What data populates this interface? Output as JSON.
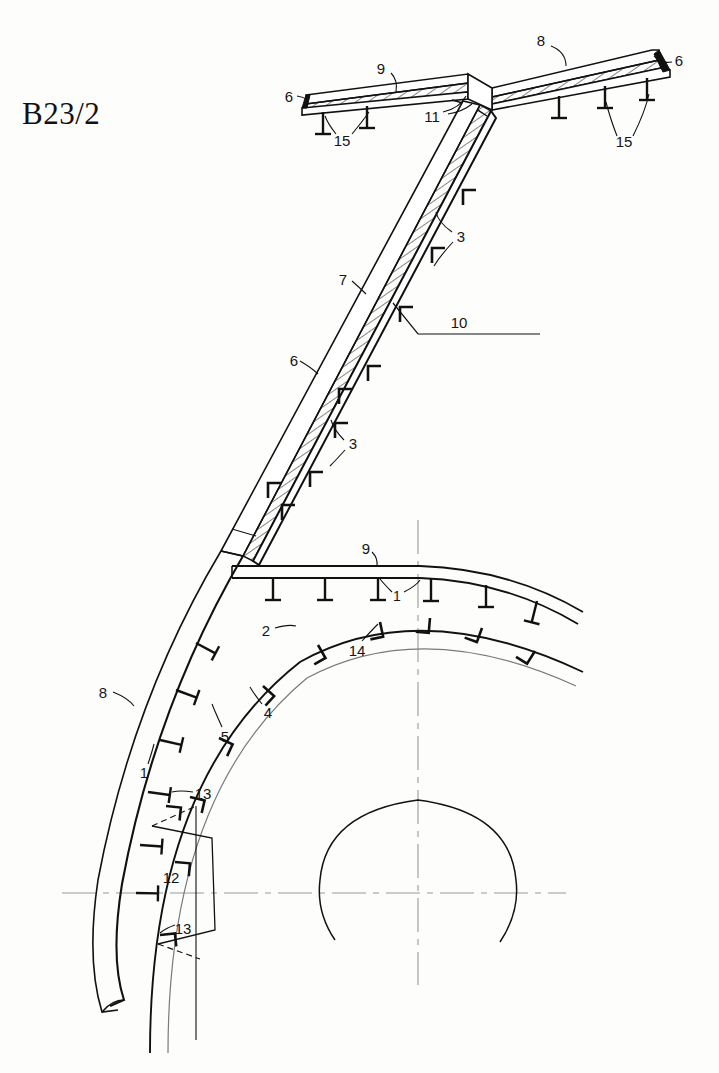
{
  "sheet": {
    "title": "B23/2",
    "background_color": "#fdfdfc",
    "ink_color": "#111111",
    "centerline_color": "#999999",
    "width": 719,
    "height": 1073
  },
  "drawing": {
    "type": "engineering-cross-section",
    "description": "Ship hull transverse frame section B23/2 with deck, diagonal strut, curved shell plating and stiffeners",
    "units": "unitless part-reference numbers"
  },
  "callouts": [
    {
      "id": "c-8-top",
      "text": "8",
      "x": 541,
      "y": 40,
      "target": "upper-right-deck-beam"
    },
    {
      "id": "c-6-tr",
      "text": "6",
      "x": 679,
      "y": 60,
      "target": "right-beam-edge-plate"
    },
    {
      "id": "c-9-top",
      "text": "9",
      "x": 381,
      "y": 68,
      "target": "upper-left-deck-plate"
    },
    {
      "id": "c-6-tl",
      "text": "6",
      "x": 289,
      "y": 96,
      "target": "left-beam-edge-plate"
    },
    {
      "id": "c-11",
      "text": "11",
      "x": 432,
      "y": 116,
      "target": "knee-bracket-fillet"
    },
    {
      "id": "c-15-l",
      "text": "15",
      "x": 342,
      "y": 140,
      "target": "left-deck-stiffeners"
    },
    {
      "id": "c-15-r",
      "text": "15",
      "x": 624,
      "y": 141,
      "target": "right-deck-stiffeners"
    },
    {
      "id": "c-3-up",
      "text": "3",
      "x": 461,
      "y": 236,
      "target": "strut-upper-brackets"
    },
    {
      "id": "c-7",
      "text": "7",
      "x": 343,
      "y": 279,
      "target": "diagonal-strut-web"
    },
    {
      "id": "c-10",
      "text": "10",
      "x": 459,
      "y": 322,
      "target": "reference-waterline"
    },
    {
      "id": "c-6-mid",
      "text": "6",
      "x": 294,
      "y": 360,
      "target": "strut-flange-plate"
    },
    {
      "id": "c-3-lo",
      "text": "3",
      "x": 353,
      "y": 443,
      "target": "strut-lower-brackets"
    },
    {
      "id": "c-9-deck",
      "text": "9",
      "x": 366,
      "y": 548,
      "target": "main-deck-plate"
    },
    {
      "id": "c-1-deck",
      "text": "1",
      "x": 397,
      "y": 596,
      "target": "deck-tee-stiffener"
    },
    {
      "id": "c-2",
      "text": "2",
      "x": 266,
      "y": 630,
      "target": "inner-arc-shell"
    },
    {
      "id": "c-14",
      "text": "14",
      "x": 357,
      "y": 650,
      "target": "arc-crown-bracket"
    },
    {
      "id": "c-8-left",
      "text": "8",
      "x": 103,
      "y": 692,
      "target": "outer-shell-plate"
    },
    {
      "id": "c-4",
      "text": "4",
      "x": 268,
      "y": 712,
      "target": "arc-stiffener-group"
    },
    {
      "id": "c-5",
      "text": "5",
      "x": 225,
      "y": 736,
      "target": "arc-inner-line"
    },
    {
      "id": "c-1-lower",
      "text": "1",
      "x": 144,
      "y": 773,
      "target": "shell-tee-stiffener"
    },
    {
      "id": "c-13-up",
      "text": "13",
      "x": 203,
      "y": 793,
      "target": "upper-panel-seam"
    },
    {
      "id": "c-12",
      "text": "12",
      "x": 171,
      "y": 877,
      "target": "hatch-panel-insert"
    },
    {
      "id": "c-13-lo",
      "text": "13",
      "x": 183,
      "y": 928,
      "target": "lower-panel-seam"
    }
  ],
  "legend_numbers": [
    "1",
    "2",
    "3",
    "4",
    "5",
    "6",
    "7",
    "8",
    "9",
    "10",
    "11",
    "12",
    "13",
    "14",
    "15"
  ]
}
